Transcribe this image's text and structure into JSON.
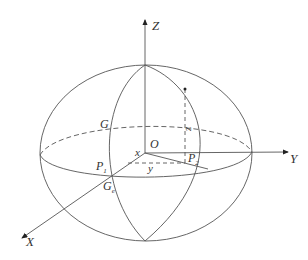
{
  "diagram": {
    "type": "ellipsoid-coordinate-system",
    "stroke_color": "#555555",
    "axes": {
      "x": {
        "label": "X"
      },
      "y": {
        "label": "Y"
      },
      "z": {
        "label": "Z"
      }
    },
    "points": {
      "origin": {
        "label": "O"
      },
      "g": {
        "label": "G"
      },
      "ge": {
        "label": "G",
        "subscript": "e"
      },
      "p1": {
        "label": "P",
        "subscript": "1"
      },
      "p2": {
        "label": "P",
        "subscript": "2"
      }
    },
    "coordinates": {
      "x": {
        "label": "x"
      },
      "y": {
        "label": "y"
      },
      "z": {
        "label": "z"
      }
    }
  }
}
